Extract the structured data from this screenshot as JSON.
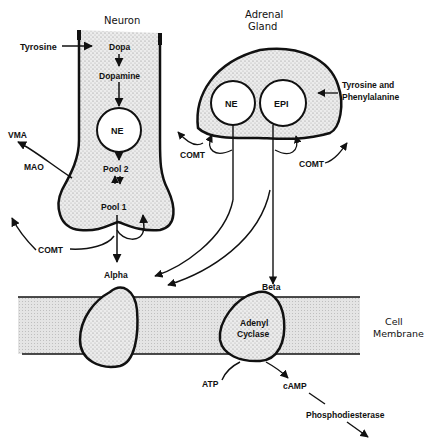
{
  "diagram": {
    "type": "biological-pathway"
  },
  "regions": {
    "neuron": {
      "title": "Neuron",
      "steps": [
        "Dopa",
        "Dopamine",
        "NE",
        "Pool 2",
        "Pool 1"
      ],
      "input": "Tyrosine",
      "metabolism": {
        "mao": "MAO",
        "vma": "VMA",
        "comt": "COMT"
      }
    },
    "adrenal": {
      "title_line1": "Adrenal",
      "title_line2": "Gland",
      "vesicles": [
        "NE",
        "EPI"
      ],
      "input_line1": "Tyrosine and",
      "input_line2": "Phenylalanine",
      "comt_left": "COMT",
      "comt_right": "COMT"
    },
    "membrane": {
      "label_line1": "Cell",
      "label_line2": "Membrane",
      "receptors": {
        "alpha": "Alpha",
        "beta": "Beta"
      },
      "enzyme_line1": "Adenyl",
      "enzyme_line2": "Cyclase"
    },
    "second_messenger": {
      "atp": "ATP",
      "camp": "cAMP",
      "degradation": "Phosphodiesterase"
    }
  },
  "colors": {
    "ink": "#111111",
    "stipple": "#d8d8d8",
    "membrane_fill": "#e6e6e6",
    "background": "#ffffff"
  }
}
